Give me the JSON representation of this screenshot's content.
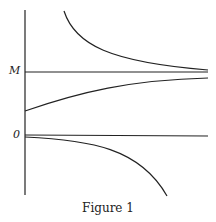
{
  "figure": {
    "caption": "Figure 1",
    "labels": {
      "m": "M",
      "zero": "0"
    }
  }
}
